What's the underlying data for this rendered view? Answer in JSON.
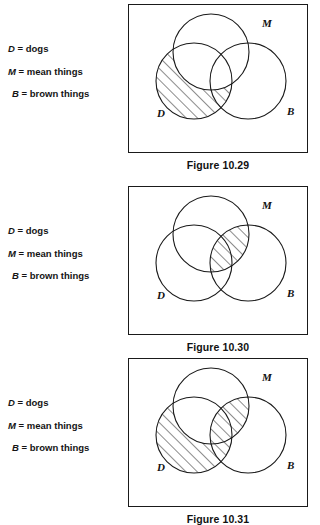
{
  "document": {
    "type": "venn-diagram-worksheet",
    "title": "Venn diagram figures 10.29, 10.30, 10.31",
    "background_color": "#ffffff",
    "stroke_color": "#1a1a1a"
  },
  "legend": {
    "rows": [
      {
        "symbol": "D",
        "equals": "=",
        "text": "dogs"
      },
      {
        "symbol": "M",
        "equals": "=",
        "text": "mean things"
      },
      {
        "symbol": "B",
        "equals": "=",
        "text": "brown things"
      }
    ]
  },
  "venn": {
    "circle_labels": {
      "d": "D",
      "m": "M",
      "b": "B"
    },
    "geometry": {
      "radius": 38,
      "d_center": [
        65,
        76
      ],
      "m_center": [
        82,
        47
      ],
      "b_center": [
        119,
        76
      ],
      "label_d": [
        28,
        112
      ],
      "label_m": [
        133,
        22
      ],
      "label_b": [
        158,
        110
      ]
    }
  },
  "panels": [
    {
      "id": "figure-10-29",
      "caption": "Figure 10.29",
      "shaded_description": "D only and D intersect B, excluding M",
      "shaded_regions": [
        "d-minus-m"
      ]
    },
    {
      "id": "figure-10-30",
      "caption": "Figure 10.30",
      "shaded_description": "M intersect B",
      "shaded_regions": [
        "m-and-b"
      ]
    },
    {
      "id": "figure-10-31",
      "caption": "Figure 10.31",
      "shaded_description": "D minus M, union M intersect B",
      "shaded_regions": [
        "d-minus-m",
        "m-and-b"
      ]
    }
  ]
}
